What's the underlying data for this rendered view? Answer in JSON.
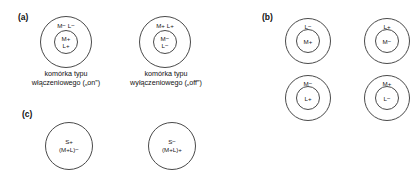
{
  "figure": {
    "panels": [
      {
        "key": "a",
        "label": "(a)",
        "items": [
          {
            "surround_label": "M−    L−",
            "center_line1": "M+",
            "center_line2": "L+",
            "caption_line1": "komórka typu",
            "caption_line2": "włączeniowego („on”)"
          },
          {
            "surround_label": "M+    L+",
            "center_line1": "M−",
            "center_line2": "L−",
            "caption_line1": "komórka typu",
            "caption_line2": "wyłączeniowego („off”)"
          }
        ]
      },
      {
        "key": "b",
        "label": "(b)",
        "items": [
          {
            "surround_label": "L−",
            "center_line1": "M+"
          },
          {
            "surround_label": "L+",
            "center_line1": "M−"
          },
          {
            "surround_label": "M−",
            "center_line1": "L+"
          },
          {
            "surround_label": "M+",
            "center_line1": "L−"
          }
        ]
      },
      {
        "key": "c",
        "label": "(c)",
        "items": [
          {
            "center_line1": "S+",
            "center_line2": "(M+L)−"
          },
          {
            "center_line1": "S−",
            "center_line2": "(M+L)+"
          }
        ]
      }
    ]
  },
  "style": {
    "stroke_color": "#4a4a4a",
    "text_color": "#1a1a1a",
    "background": "#ffffff"
  }
}
